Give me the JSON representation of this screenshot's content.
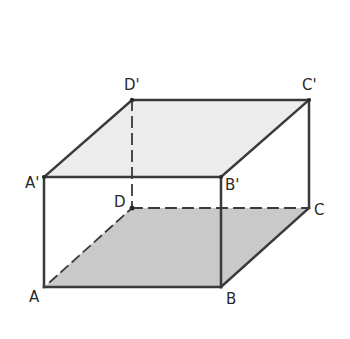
{
  "diagram": {
    "type": "rectangular-prism",
    "colors": {
      "edge": "#3a3a3a",
      "top_face": "#ececec",
      "bottom_face": "#c9c9c9",
      "background": "#ffffff"
    },
    "vertices": {
      "A": {
        "label": "A",
        "x": 44,
        "y": 287
      },
      "B": {
        "label": "B",
        "x": 221,
        "y": 287
      },
      "C": {
        "label": "C",
        "x": 309,
        "y": 208
      },
      "D": {
        "label": "D",
        "x": 132,
        "y": 208
      },
      "A1": {
        "label": "A'",
        "x": 44,
        "y": 177
      },
      "B1": {
        "label": "B'",
        "x": 221,
        "y": 177
      },
      "C1": {
        "label": "C'",
        "x": 309,
        "y": 100
      },
      "D1": {
        "label": "D'",
        "x": 132,
        "y": 100
      }
    },
    "shaded_faces": [
      {
        "name": "top",
        "vertices": [
          "A'",
          "B'",
          "C'",
          "D'"
        ],
        "shade": "light"
      },
      {
        "name": "bottom",
        "vertices": [
          "A",
          "B",
          "C",
          "D"
        ],
        "shade": "medium"
      }
    ],
    "solid_edges": [
      "AB",
      "BC",
      "AA'",
      "BB'",
      "CC'",
      "A'B'",
      "B'C'",
      "C'D'",
      "D'A'"
    ],
    "dashed_edges": [
      "AD",
      "DC",
      "DD'"
    ]
  }
}
